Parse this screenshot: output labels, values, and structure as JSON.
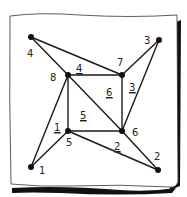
{
  "diagram": {
    "type": "graph",
    "nodes": [
      {
        "id": "1",
        "label": "1",
        "x": 31,
        "y": 167,
        "lx": 39,
        "ly": 174
      },
      {
        "id": "2",
        "label": "2",
        "x": 158,
        "y": 170,
        "lx": 154,
        "ly": 160
      },
      {
        "id": "3",
        "label": "3",
        "x": 159,
        "y": 40,
        "lx": 144,
        "ly": 44
      },
      {
        "id": "4",
        "label": "4",
        "x": 31,
        "y": 37,
        "lx": 27,
        "ly": 57
      },
      {
        "id": "5",
        "label": "5",
        "x": 68,
        "y": 131,
        "lx": 66,
        "ly": 146
      },
      {
        "id": "6",
        "label": "6",
        "x": 122,
        "y": 131,
        "lx": 132,
        "ly": 136
      },
      {
        "id": "7",
        "label": "7",
        "x": 122,
        "y": 75,
        "lx": 117,
        "ly": 66
      },
      {
        "id": "8",
        "label": "8",
        "x": 68,
        "y": 75,
        "lx": 50,
        "ly": 81
      }
    ],
    "edges": [
      {
        "from": "4",
        "to": "8"
      },
      {
        "from": "4",
        "to": "7"
      },
      {
        "from": "3",
        "to": "7"
      },
      {
        "from": "3",
        "to": "6"
      },
      {
        "from": "1",
        "to": "8"
      },
      {
        "from": "1",
        "to": "5"
      },
      {
        "from": "2",
        "to": "5"
      },
      {
        "from": "2",
        "to": "6"
      },
      {
        "from": "8",
        "to": "7"
      },
      {
        "from": "7",
        "to": "6"
      },
      {
        "from": "6",
        "to": "5"
      },
      {
        "from": "5",
        "to": "8"
      },
      {
        "from": "8",
        "to": "6"
      }
    ],
    "edge_labels": [
      {
        "label": "4",
        "x": 76,
        "y": 72
      },
      {
        "label": "3",
        "x": 129,
        "y": 91
      },
      {
        "label": "6",
        "x": 106,
        "y": 96
      },
      {
        "label": "5",
        "x": 80,
        "y": 119
      },
      {
        "label": "1",
        "x": 54,
        "y": 131
      },
      {
        "label": "2",
        "x": 114,
        "y": 150
      }
    ],
    "colors": {
      "line": "#1a1a1a",
      "node": "#111111",
      "paper": "#ffffff",
      "shadow": "#111111"
    }
  }
}
